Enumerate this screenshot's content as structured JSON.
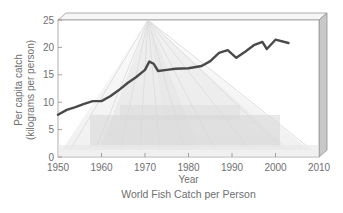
{
  "chart_data": {
    "type": "line",
    "title": "World Fish Catch per Person",
    "xlabel": "Year",
    "ylabel": "Per capita catch",
    "ylabel_units": "(kilograms per person)",
    "xlim": [
      1950,
      2010
    ],
    "ylim": [
      0,
      25
    ],
    "x_ticks": [
      1950,
      1960,
      1970,
      1980,
      1990,
      2000,
      2010
    ],
    "y_ticks": [
      0,
      5,
      10,
      15,
      20,
      25
    ],
    "grid": false,
    "legend": null,
    "background_image": "fishing-net-photo",
    "series": [
      {
        "name": "Per capita catch",
        "color": "#4a4a4a",
        "x": [
          1950,
          1952,
          1954,
          1956,
          1958,
          1960,
          1962,
          1964,
          1966,
          1968,
          1970,
          1971,
          1972,
          1973,
          1975,
          1977,
          1980,
          1983,
          1985,
          1987,
          1989,
          1991,
          1993,
          1995,
          1997,
          1998,
          2000,
          2003
        ],
        "values": [
          7.7,
          8.6,
          9.1,
          9.7,
          10.2,
          10.2,
          11.1,
          12.2,
          13.5,
          14.6,
          15.9,
          17.4,
          17.0,
          15.7,
          15.9,
          16.1,
          16.2,
          16.6,
          17.5,
          19.0,
          19.5,
          18.1,
          19.2,
          20.4,
          21.0,
          19.7,
          21.4,
          20.8
        ]
      }
    ]
  },
  "labels": {
    "ylabel_line1": "Per capita catch",
    "ylabel_line2": "(kilograms per person)",
    "xlabel": "Year",
    "caption": "World Fish Catch per Person",
    "x_ticks": [
      "1950",
      "1960",
      "1970",
      "1980",
      "1990",
      "2000",
      "2010"
    ],
    "y_ticks": [
      "0",
      "5",
      "10",
      "15",
      "20",
      "25"
    ]
  }
}
